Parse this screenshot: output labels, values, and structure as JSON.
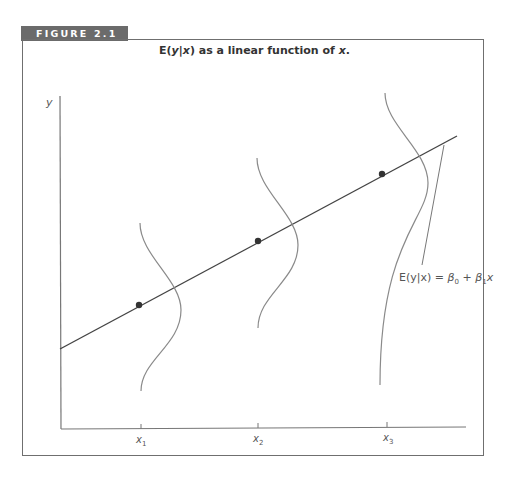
{
  "figure": {
    "tab_label": "FIGURE 2.1",
    "title_prefix": "E(",
    "title_y": "y",
    "title_bar": "|",
    "title_x": "x",
    "title_suffix": ") as a linear function of ",
    "title_x2": "x",
    "title_end": "."
  },
  "axes": {
    "y_label": "y",
    "x_ticks": [
      {
        "label": "x",
        "sub": "1"
      },
      {
        "label": "x",
        "sub": "2"
      },
      {
        "label": "x",
        "sub": "3"
      }
    ]
  },
  "annotation": {
    "text_lhs": "E(y|x) = ",
    "beta0": "β",
    "beta0_sub": "0",
    "plus": " + ",
    "beta1": "β",
    "beta1_sub": "1",
    "x": "x"
  },
  "colors": {
    "tab_bg": "#6b6b6b",
    "frame": "#6f6f6f",
    "line": "#444444",
    "curve": "#8a8a8a",
    "point": "#333333"
  }
}
